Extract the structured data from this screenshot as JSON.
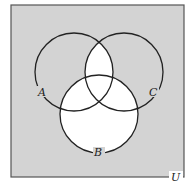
{
  "diagram": {
    "type": "venn",
    "universe_label": "U",
    "sets": [
      {
        "id": "A",
        "label": "A"
      },
      {
        "id": "B",
        "label": "B"
      },
      {
        "id": "C",
        "label": "C"
      }
    ],
    "shaded_region": "complement of (B ∪ (A ∩ C))",
    "unshaded_regions": [
      "B",
      "A ∩ C"
    ],
    "colors": {
      "shaded": "#d3d3d3",
      "unshaded": "#ffffff",
      "outline": "#222222",
      "frame": "#555555"
    }
  }
}
